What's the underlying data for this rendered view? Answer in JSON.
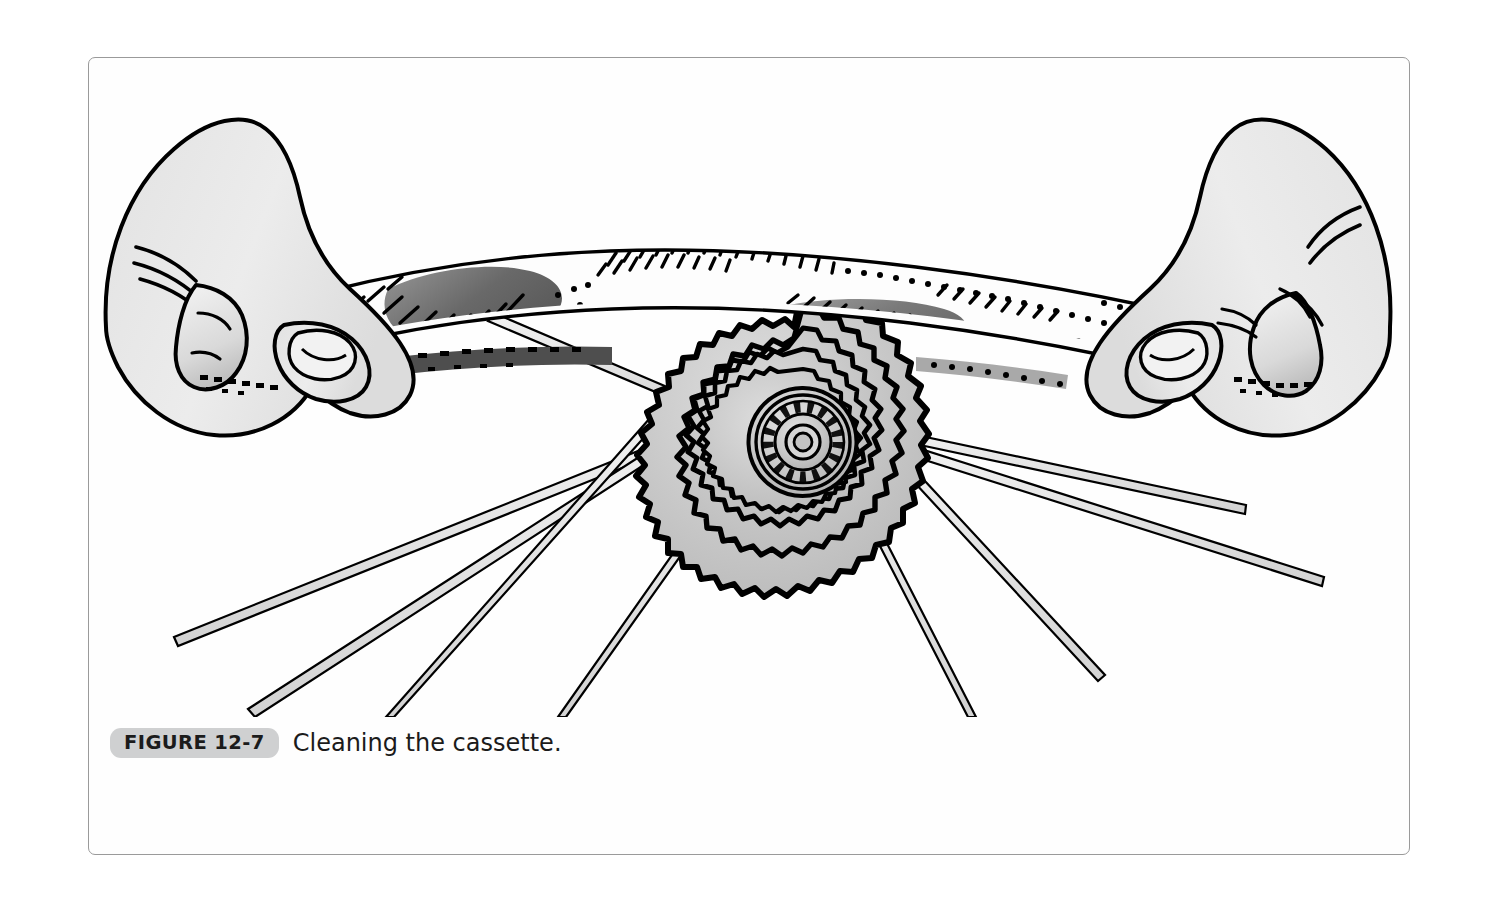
{
  "page": {
    "background_color": "#ffffff",
    "frame_color": "#9a9a9a"
  },
  "caption": {
    "figure_label": "FIGURE 12-7",
    "text": "Cleaning the cassette.",
    "badge_color": "#cfd0d1",
    "text_color": "#1b1b1b"
  },
  "illustration": {
    "title": "Cleaning the cassette",
    "description": "Two hands pulling a rag back and forth across a bicycle rear cassette; spokes radiate outward behind the sprockets.",
    "ink_color": "#000000",
    "skin_fill": "#e8e8e8",
    "metal_fill": "#c9c9c9",
    "rag_fill": "#fdfdfd",
    "grime_color": "#595959",
    "parts": [
      {
        "name": "left-hand",
        "label": "Left hand gripping rag"
      },
      {
        "name": "right-hand",
        "label": "Right hand gripping rag"
      },
      {
        "name": "cleaning-rag",
        "label": "Cleaning rag with grease smudges"
      },
      {
        "name": "cassette",
        "label": "Rear cassette sprocket stack"
      },
      {
        "name": "cassette-hub",
        "label": "Freehub body / lockring center"
      },
      {
        "name": "spokes",
        "label": "Wheel spokes"
      }
    ],
    "cassette": {
      "sprocket_rings": 7,
      "teeth_counts": [
        30,
        26,
        22,
        18,
        15,
        12,
        10
      ],
      "center_x": 715,
      "center_y": 385,
      "outer_radius": 160
    },
    "spokes": {
      "count": 8,
      "fill": "#e0e0e0"
    }
  }
}
